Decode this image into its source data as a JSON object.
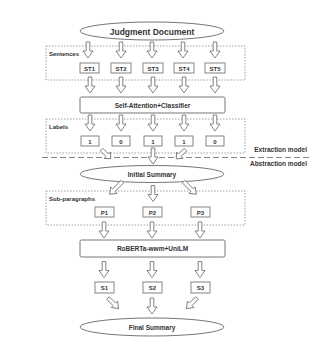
{
  "diagram": {
    "input": "Judgment Document",
    "sentences_group_label": "Sentences",
    "sentences": [
      "ST1",
      "ST2",
      "ST3",
      "ST4",
      "ST5"
    ],
    "extractor": "Self-Attention+Classifier",
    "labels_group_label": "Labels",
    "labels": [
      "1",
      "0",
      "1",
      "1",
      "0"
    ],
    "extraction_model_label": "Extraction model",
    "abstraction_model_label": "Abstraction model",
    "initial_summary": "Initial Summary",
    "subparagraphs_group_label": "Sub-paragraphs",
    "subparagraphs": [
      "P1",
      "P2",
      "P3"
    ],
    "abstractor": "RoBERTa-wwm+UniLM",
    "summaries": [
      "S1",
      "S2",
      "S3"
    ],
    "output": "Final Summary"
  }
}
